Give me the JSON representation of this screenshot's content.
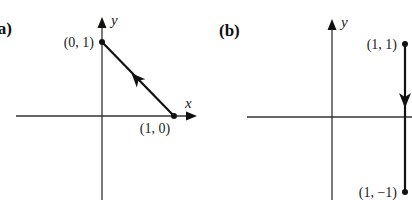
{
  "panels": [
    {
      "label": "(a)",
      "axis_labels": {
        "x": "x",
        "y": "y"
      },
      "points": [
        {
          "label": "(0, 1)",
          "x": 0,
          "y": 1
        },
        {
          "label": "(1, 0)",
          "x": 1,
          "y": 0
        }
      ],
      "path": {
        "from": "(1, 0)",
        "to": "(0, 1)",
        "direction": "up-left"
      }
    },
    {
      "label": "(b)",
      "axis_labels": {
        "y": "y"
      },
      "points": [
        {
          "label": "(1, 1)",
          "x": 1,
          "y": 1
        },
        {
          "label": "(1, −1)",
          "x": 1,
          "y": -1
        }
      ],
      "path": {
        "from": "(1, 1)",
        "to": "(1, −1)",
        "direction": "down"
      }
    }
  ],
  "colors": {
    "ink": "#111111",
    "axis": "#333333",
    "background": "#ffffff"
  }
}
